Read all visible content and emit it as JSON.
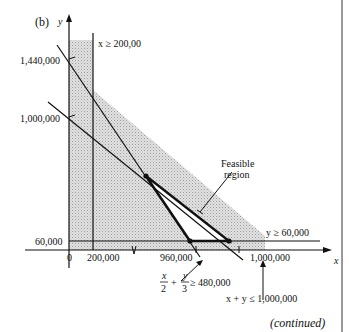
{
  "figure": {
    "panel_label": "(b)",
    "continued_label": "(continued)",
    "axes": {
      "x_label": "x",
      "y_label": "y",
      "origin_label": "0",
      "x_ticks": [
        "200,000",
        "960,000",
        "1,000,000"
      ],
      "y_ticks": [
        "60,000",
        "1,000,000",
        "1,440,000"
      ]
    },
    "constraints": {
      "x_min": "x ≥ 200,00",
      "y_min": "y ≥ 60,000",
      "sum_max": "x + y ≤ 1,000,000",
      "weighted_min_lhs_x_num": "x",
      "weighted_min_lhs_x_den": "2",
      "weighted_min_lhs_y_num": "y",
      "weighted_min_lhs_y_den": "3",
      "weighted_min_rhs": "≥ 480,000",
      "plus": "+"
    },
    "region_label_line1": "Feasible",
    "region_label_line2": "region"
  },
  "colors": {
    "ink": "#111111",
    "shade": "#d4d4d4",
    "background": "#ffffff"
  }
}
